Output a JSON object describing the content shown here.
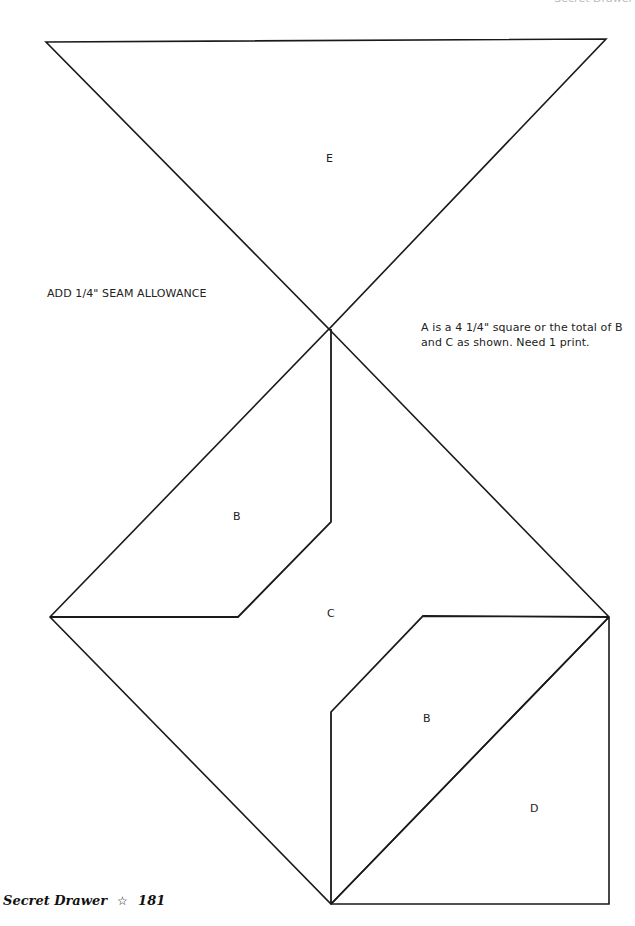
{
  "header": {
    "running_head": "Secret Drawer"
  },
  "notes": {
    "seam_allowance": "ADD 1/4\" SEAM ALLOWANCE",
    "piece_a": "A is a 4 1/4\" square or the total of B and C as shown. Need 1 print."
  },
  "labels": {
    "e": "E",
    "b_upper": "B",
    "c": "C",
    "b_lower": "B",
    "d": "D"
  },
  "footer": {
    "title": "Secret Drawer",
    "star_icon": "☆",
    "page_number": "181"
  },
  "colors": {
    "line": "#1a1a1a",
    "background": "#ffffff"
  }
}
